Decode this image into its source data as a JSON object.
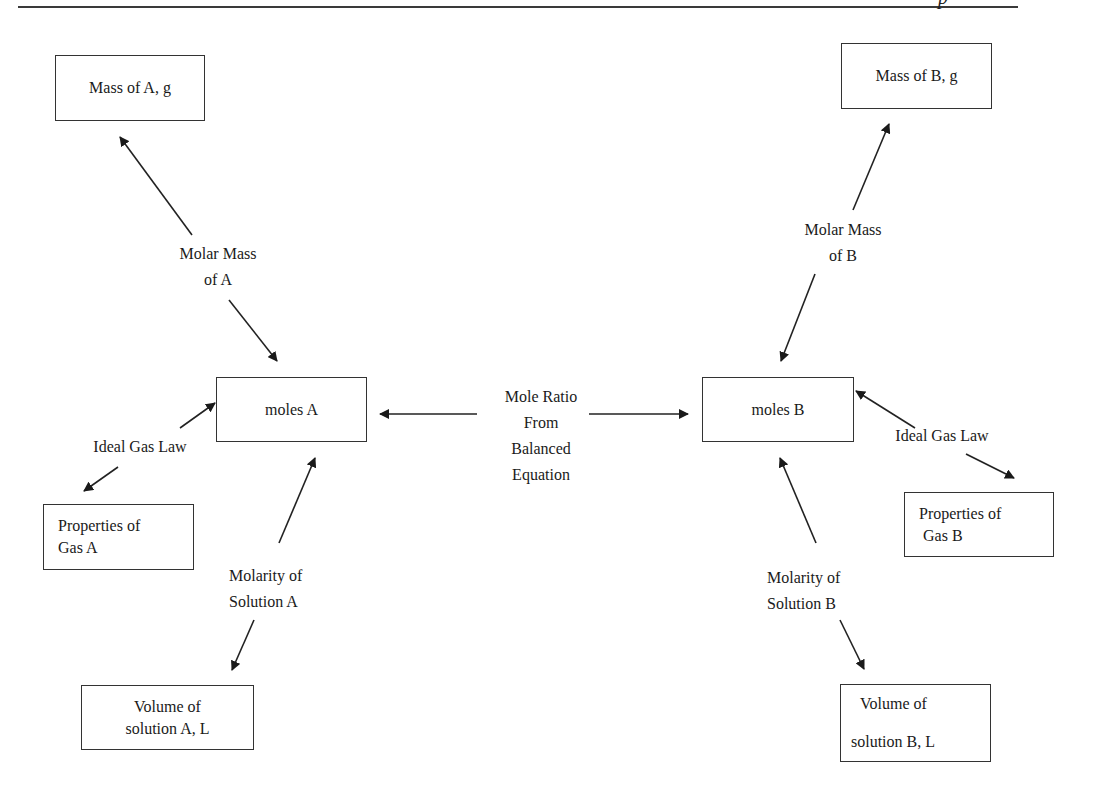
{
  "header": {
    "glyph": "p"
  },
  "boxes": {
    "mass_a": {
      "lines": [
        "Mass of A, g"
      ]
    },
    "mass_b": {
      "lines": [
        "Mass of B, g"
      ]
    },
    "moles_a": {
      "lines": [
        "moles A"
      ]
    },
    "moles_b": {
      "lines": [
        "moles B"
      ]
    },
    "gas_a": {
      "lines": [
        "Properties of",
        "Gas A"
      ]
    },
    "gas_b": {
      "lines": [
        "Properties of",
        "Gas B"
      ]
    },
    "volume_a": {
      "lines": [
        "Volume of",
        "solution A, L"
      ]
    },
    "volume_b": {
      "lines": [
        "Volume of",
        "solution B, L"
      ]
    }
  },
  "labels": {
    "molar_mass_a": {
      "lines": [
        "Molar Mass",
        "of A"
      ]
    },
    "molar_mass_b": {
      "lines": [
        "Molar Mass",
        "of B"
      ]
    },
    "ideal_gas_a": {
      "lines": [
        "Ideal Gas Law"
      ]
    },
    "ideal_gas_b": {
      "lines": [
        "Ideal Gas Law"
      ]
    },
    "molarity_a": {
      "lines": [
        "Molarity of",
        "Solution A"
      ]
    },
    "molarity_b": {
      "lines": [
        "Molarity of",
        "Solution B"
      ]
    },
    "mole_ratio": {
      "lines": [
        "Mole Ratio",
        "From",
        "Balanced",
        "Equation"
      ]
    }
  },
  "colors": {
    "line": "#222222",
    "background": "#ffffff"
  }
}
